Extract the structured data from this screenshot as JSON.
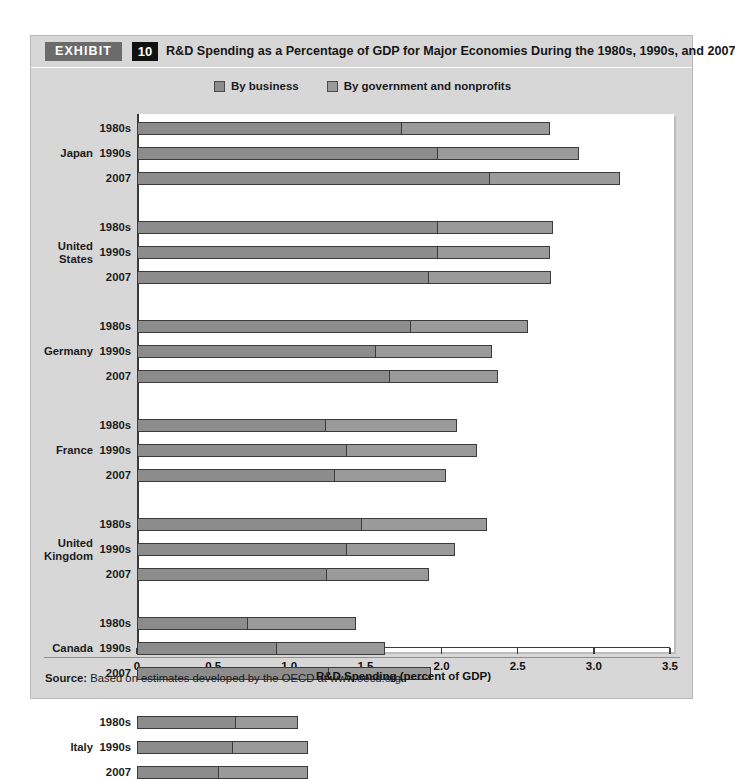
{
  "exhibit": {
    "tag": "EXHIBIT",
    "number": "10",
    "title": "R&D Spending as a Percentage of GDP for Major Economies During the 1980s, 1990s, and 2007"
  },
  "source": {
    "label": "Source:",
    "text": " Based on estimates developed by the OECD at www.oecd.org."
  },
  "colors": {
    "panel_background": "#d7d7d7",
    "plot_background": "#ffffff",
    "business_segment": "#8c8c8c",
    "government_segment": "#9a9a9a",
    "segment_border": "#3b3b3b",
    "axis": "#3a3a3a",
    "exhibit_tag_background": "#6b6b6b",
    "exhibit_number_background": "#111111"
  },
  "chart_data": {
    "type": "bar",
    "orientation": "horizontal",
    "stacked": true,
    "title": "R&D Spending as a Percentage of GDP for Major Economies During the 1980s, 1990s, and 2007",
    "xlabel": "R&D Spending (percent of GDP)",
    "ylabel": "",
    "xlim": [
      0,
      3.5
    ],
    "xticks": [
      0,
      0.5,
      1.0,
      1.5,
      2.0,
      2.5,
      3.0,
      3.5
    ],
    "xticklabels": [
      "0",
      "0.5",
      "1.0",
      "1.5",
      "2.0",
      "2.5",
      "3.0",
      "3.5"
    ],
    "grid": false,
    "legend_position": "top-center",
    "legend": [
      {
        "name": "By business",
        "color": "#8c8c8c"
      },
      {
        "name": "By government and nonprofits",
        "color": "#9a9a9a"
      }
    ],
    "series": [
      {
        "name": "By business"
      },
      {
        "name": "By government and nonprofits"
      }
    ],
    "groups": [
      {
        "country": "Japan",
        "rows": [
          {
            "period": "1980s",
            "business": 1.74,
            "government": 0.97,
            "total": 2.71
          },
          {
            "period": "1990s",
            "business": 1.98,
            "government": 0.92,
            "total": 2.9
          },
          {
            "period": "2007",
            "business": 2.32,
            "government": 0.85,
            "total": 3.17
          }
        ]
      },
      {
        "country": "United States",
        "rows": [
          {
            "period": "1980s",
            "business": 1.98,
            "government": 0.75,
            "total": 2.73
          },
          {
            "period": "1990s",
            "business": 1.98,
            "government": 0.73,
            "total": 2.71
          },
          {
            "period": "2007",
            "business": 1.92,
            "government": 0.8,
            "total": 2.72
          }
        ]
      },
      {
        "country": "Germany",
        "rows": [
          {
            "period": "1980s",
            "business": 1.8,
            "government": 0.77,
            "total": 2.57
          },
          {
            "period": "1990s",
            "business": 1.57,
            "government": 0.76,
            "total": 2.33
          },
          {
            "period": "2007",
            "business": 1.66,
            "government": 0.71,
            "total": 2.37
          }
        ]
      },
      {
        "country": "France",
        "rows": [
          {
            "period": "1980s",
            "business": 1.24,
            "government": 0.86,
            "total": 2.1
          },
          {
            "period": "1990s",
            "business": 1.38,
            "government": 0.85,
            "total": 2.23
          },
          {
            "period": "2007",
            "business": 1.3,
            "government": 0.73,
            "total": 2.03
          }
        ]
      },
      {
        "country": "United Kingdom",
        "rows": [
          {
            "period": "1980s",
            "business": 1.48,
            "government": 0.82,
            "total": 2.3
          },
          {
            "period": "1990s",
            "business": 1.38,
            "government": 0.71,
            "total": 2.09
          },
          {
            "period": "2007",
            "business": 1.25,
            "government": 0.67,
            "total": 1.92
          }
        ]
      },
      {
        "country": "Canada",
        "rows": [
          {
            "period": "1980s",
            "business": 0.73,
            "government": 0.71,
            "total": 1.44
          },
          {
            "period": "1990s",
            "business": 0.92,
            "government": 0.71,
            "total": 1.63
          },
          {
            "period": "2007",
            "business": 1.26,
            "government": 0.67,
            "total": 1.93
          }
        ]
      },
      {
        "country": "Italy",
        "rows": [
          {
            "period": "1980s",
            "business": 0.65,
            "government": 0.41,
            "total": 1.06
          },
          {
            "period": "1990s",
            "business": 0.63,
            "government": 0.49,
            "total": 1.12
          },
          {
            "period": "2007",
            "business": 0.54,
            "government": 0.58,
            "total": 1.12
          }
        ]
      }
    ]
  }
}
